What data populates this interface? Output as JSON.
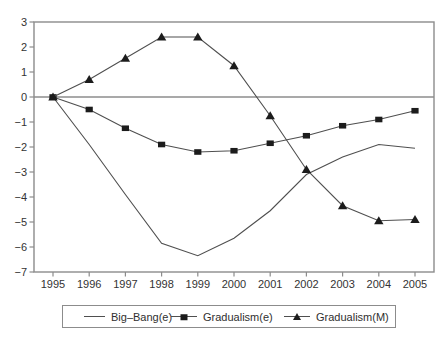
{
  "colors": {
    "background": "#ffffff",
    "frame": "#8c8c8c",
    "series_line": "#4f4f4f",
    "marker": "#1c1c1c",
    "text": "#333333",
    "legend_border": "#8c8c8c"
  },
  "chart_data": {
    "type": "line",
    "title": "",
    "xlabel": "",
    "ylabel": "",
    "x": [
      1995,
      1996,
      1997,
      1998,
      1999,
      2000,
      2001,
      2002,
      2003,
      2004,
      2005
    ],
    "xtick_labels": [
      "1995",
      "1996",
      "1997",
      "1998",
      "1999",
      "2000",
      "2001",
      "2002",
      "2003",
      "2004",
      "2005"
    ],
    "series": [
      {
        "name": "Big–Bang(e)",
        "marker": "none",
        "values": [
          0,
          -1.9,
          -3.9,
          -5.85,
          -6.35,
          -5.65,
          -4.55,
          -3.1,
          -2.4,
          -1.9,
          -2.05
        ]
      },
      {
        "name": "Gradualism(e)",
        "marker": "square",
        "values": [
          0,
          -0.5,
          -1.25,
          -1.9,
          -2.2,
          -2.15,
          -1.85,
          -1.55,
          -1.15,
          -0.9,
          -0.55
        ]
      },
      {
        "name": "Gradualism(M)",
        "marker": "triangle",
        "values": [
          0,
          0.7,
          1.55,
          2.4,
          2.4,
          1.25,
          -0.75,
          -2.9,
          -4.35,
          -4.95,
          -4.9
        ]
      }
    ],
    "ylim": [
      -7,
      3
    ],
    "yticks": [
      3,
      2,
      1,
      0,
      -1,
      -2,
      -3,
      -4,
      -5,
      -6,
      -7
    ],
    "ytick_labels": [
      "3",
      "2",
      "1",
      "0",
      "−1",
      "−2",
      "−3",
      "−4",
      "−5",
      "−6",
      "−7"
    ],
    "grid": false,
    "zero_line": true,
    "legend_position": "bottom"
  }
}
